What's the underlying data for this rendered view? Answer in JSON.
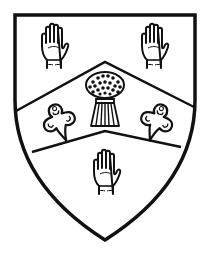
{
  "emblem": {
    "type": "heraldic-shield",
    "colors": {
      "field": "#ffffff",
      "line": "#111111",
      "background": "#ffffff"
    },
    "ordinary": "chevron",
    "charges": {
      "upper_left": "hand",
      "upper_right": "hand",
      "chevron_center": "wheat-sheaf",
      "chevron_left": "trefoil-slipped",
      "chevron_right": "trefoil-slipped",
      "base": "hand"
    }
  }
}
